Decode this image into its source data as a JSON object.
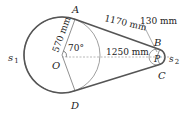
{
  "diagram": {
    "type": "belt-pulley",
    "points": {
      "A": "A",
      "B": "B",
      "C": "C",
      "D": "D",
      "O": "O",
      "P": "P"
    },
    "belt_labels": {
      "s1": "s",
      "s1_sub": "1",
      "s2": "s",
      "s2_sub": "2"
    },
    "dimensions": {
      "large_radius": "570 mm",
      "small_radius": "130 mm",
      "tangent_length": "1170 mm",
      "center_distance": "1250 mm",
      "angle": "70°"
    },
    "colors": {
      "belt": "#555555",
      "line": "#444444",
      "dashed": "#999999"
    }
  }
}
